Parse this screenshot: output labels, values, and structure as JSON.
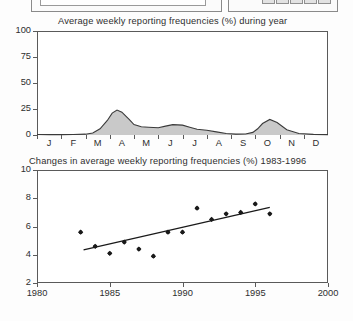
{
  "toolbar": {
    "text_field_value": "",
    "cells": [
      "cell-1",
      "cell-2",
      "cell-3",
      "cell-4",
      "cell-5"
    ]
  },
  "chart_data": [
    {
      "id": "seasonal",
      "type": "area",
      "title": "Average weekly reporting frequencies (%) during year",
      "xlabel": "",
      "ylabel": "",
      "ylim": [
        0,
        100
      ],
      "yticks": [
        0,
        25,
        50,
        75,
        100
      ],
      "ytick_labels": [
        "0",
        "25",
        "50",
        "75",
        "100"
      ],
      "categories": [
        "J",
        "F",
        "M",
        "A",
        "M",
        "J",
        "J",
        "A",
        "S",
        "O",
        "N",
        "D"
      ],
      "grid": false,
      "legend": "none",
      "fill_color": "#c9c9c9",
      "line_color": "#3a3a3a",
      "x": [
        0.0,
        0.5,
        1.0,
        1.5,
        2.0,
        2.3,
        2.6,
        2.9,
        3.1,
        3.3,
        3.5,
        3.8,
        4.0,
        4.3,
        4.6,
        5.0,
        5.3,
        5.6,
        6.0,
        6.3,
        6.6,
        7.0,
        7.4,
        7.8,
        8.2,
        8.6,
        8.9,
        9.1,
        9.3,
        9.6,
        9.9,
        10.3,
        10.8,
        11.4,
        12.0
      ],
      "values": [
        0.5,
        0.4,
        0.4,
        0.5,
        0.8,
        2.0,
        6.0,
        14.0,
        21.0,
        24.0,
        22.0,
        15.0,
        10.0,
        8.0,
        7.5,
        7.0,
        8.5,
        10.0,
        9.5,
        7.5,
        5.5,
        4.5,
        3.0,
        1.5,
        0.8,
        1.0,
        2.5,
        6.0,
        11.0,
        15.0,
        12.0,
        5.0,
        1.5,
        0.6,
        0.4
      ]
    },
    {
      "id": "trend",
      "type": "scatter",
      "title": "Changes in average weekly reporting frequencies (%) 1983-1996",
      "xlabel": "",
      "ylabel": "",
      "xlim": [
        1980,
        2000
      ],
      "ylim": [
        2,
        10
      ],
      "xticks": [
        1980,
        1985,
        1990,
        1995,
        2000
      ],
      "xtick_labels": [
        "1980",
        "1985",
        "1990",
        "1995",
        "2000"
      ],
      "yticks": [
        2,
        4,
        6,
        8,
        10
      ],
      "ytick_labels": [
        "2",
        "4",
        "6",
        "8",
        "10"
      ],
      "grid": false,
      "legend": "none",
      "marker_color": "#1a1a1a",
      "trendline_color": "#1a1a1a",
      "points": [
        {
          "x": 1983.0,
          "y": 5.6
        },
        {
          "x": 1984.0,
          "y": 4.6
        },
        {
          "x": 1985.0,
          "y": 4.1
        },
        {
          "x": 1986.0,
          "y": 4.9
        },
        {
          "x": 1987.0,
          "y": 4.4
        },
        {
          "x": 1988.0,
          "y": 3.9
        },
        {
          "x": 1989.0,
          "y": 5.6
        },
        {
          "x": 1990.0,
          "y": 5.6
        },
        {
          "x": 1991.0,
          "y": 7.3
        },
        {
          "x": 1992.0,
          "y": 6.5
        },
        {
          "x": 1993.0,
          "y": 6.9
        },
        {
          "x": 1994.0,
          "y": 7.0
        },
        {
          "x": 1995.0,
          "y": 7.6
        },
        {
          "x": 1996.0,
          "y": 6.9
        }
      ],
      "trendline": {
        "x1": 1983.2,
        "y1": 4.35,
        "x2": 1996.0,
        "y2": 7.35
      }
    }
  ]
}
